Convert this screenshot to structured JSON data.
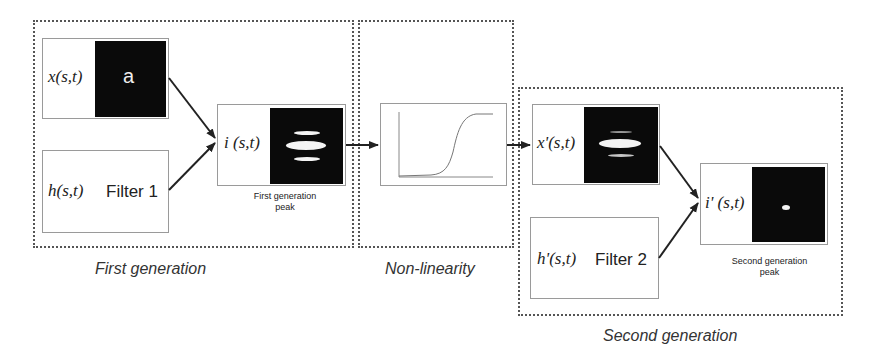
{
  "diagram": {
    "groups": {
      "first": {
        "label": "First generation"
      },
      "nonlinear": {
        "label": "Non-linearity"
      },
      "second": {
        "label": "Second generation"
      }
    },
    "nodes": {
      "x": {
        "symbol": "x(s,t)",
        "image_letter": "a"
      },
      "h": {
        "symbol": "h(s,t)",
        "filter_label": "Filter 1"
      },
      "i": {
        "symbol": "i (s,t)",
        "caption_line1": "First generation",
        "caption_line2": "peak"
      },
      "xp": {
        "symbol": "x'(s,t)"
      },
      "hp": {
        "symbol": "h'(s,t)",
        "filter_label": "Filter 2"
      },
      "ip": {
        "symbol": "i' (s,t)",
        "caption_line1": "Second generation",
        "caption_line2": "peak"
      }
    },
    "edges": [
      {
        "from": "x(s,t)",
        "to": "i(s,t)"
      },
      {
        "from": "h(s,t)",
        "to": "i(s,t)"
      },
      {
        "from": "i(s,t)",
        "to": "non-linearity"
      },
      {
        "from": "non-linearity",
        "to": "x'(s,t)"
      },
      {
        "from": "x'(s,t)",
        "to": "i'(s,t)"
      },
      {
        "from": "h'(s,t)",
        "to": "i'(s,t)"
      }
    ],
    "colors": {
      "image_bg": "#0a0a0a",
      "peak": "#f4f4f4",
      "border": "#9a9a9a",
      "group_border": "#555555"
    }
  }
}
